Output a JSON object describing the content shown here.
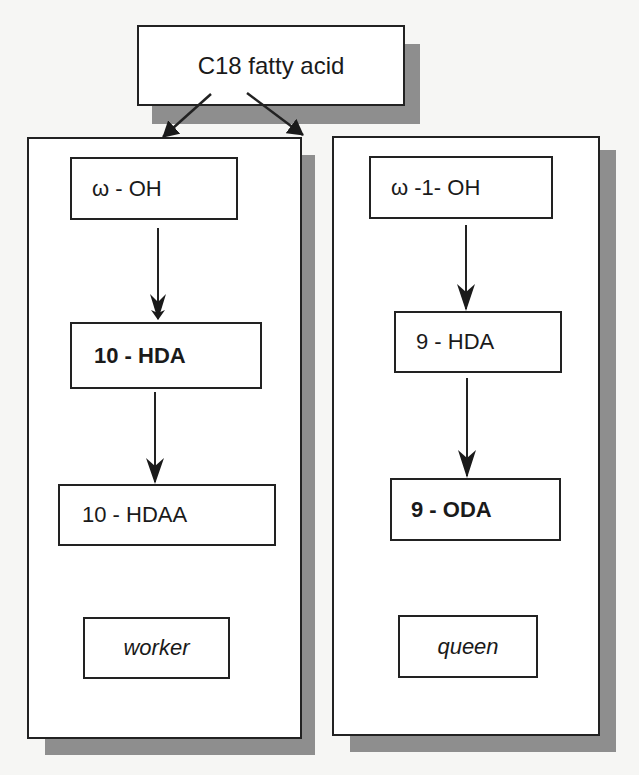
{
  "diagram": {
    "root": {
      "label": "C18 fatty acid"
    },
    "branches": [
      {
        "id": "worker",
        "nodes": [
          {
            "label": "ω - OH",
            "style": "normal"
          },
          {
            "label": "10 - HDA",
            "style": "bold"
          },
          {
            "label": "10 - HDAA",
            "style": "normal"
          }
        ],
        "caste": {
          "label": "worker",
          "style": "italic"
        }
      },
      {
        "id": "queen",
        "nodes": [
          {
            "label": "ω -1- OH",
            "style": "normal"
          },
          {
            "label": "9 - HDA",
            "style": "normal"
          },
          {
            "label": "9 - ODA",
            "style": "bold"
          }
        ],
        "caste": {
          "label": "queen",
          "style": "italic"
        }
      }
    ],
    "edges": [
      {
        "from": "C18 fatty acid",
        "to": "ω - OH"
      },
      {
        "from": "C18 fatty acid",
        "to": "ω -1- OH"
      },
      {
        "from": "ω - OH",
        "to": "10 - HDA"
      },
      {
        "from": "10 - HDA",
        "to": "10 - HDAA"
      },
      {
        "from": "ω -1- OH",
        "to": "9 - HDA"
      },
      {
        "from": "9 - HDA",
        "to": "9 - ODA"
      }
    ],
    "colors": {
      "stroke": "#222222",
      "shadow": "#8e8e8e",
      "fill": "#ffffff"
    }
  }
}
